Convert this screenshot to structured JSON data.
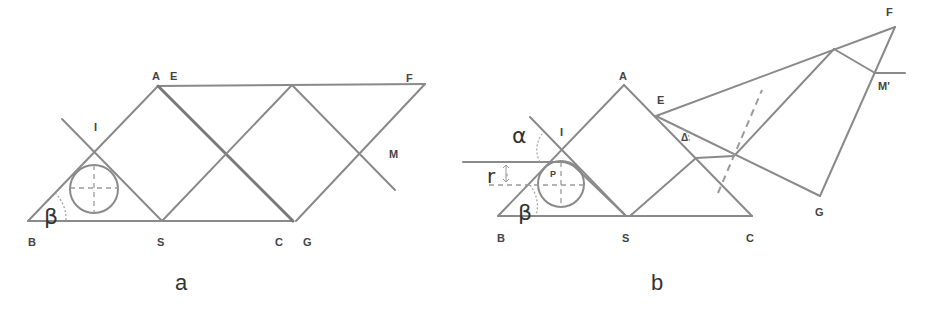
{
  "figure_a": {
    "caption": "a",
    "labels": {
      "A": "A",
      "E": "E",
      "F": "F",
      "I": "I",
      "M": "M",
      "B": "B",
      "S": "S",
      "C": "C",
      "G": "G",
      "beta": "β"
    }
  },
  "figure_b": {
    "caption": "b",
    "labels": {
      "A": "A",
      "E": "E",
      "F": "F",
      "I": "I",
      "P": "P",
      "M": "M'",
      "B": "B",
      "S": "S",
      "C": "C",
      "G": "G",
      "alpha": "α",
      "beta": "β",
      "r": "r",
      "delta": "Δ"
    }
  },
  "colors": {
    "line": "#8a8a8a",
    "text": "#333333"
  }
}
